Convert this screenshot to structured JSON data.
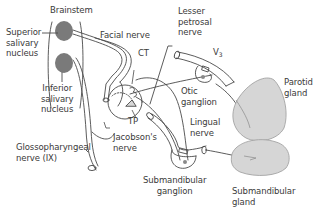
{
  "diagram": {
    "colors": {
      "line": "#4a4a4a",
      "nucleus_fill": "#7a7a7a",
      "gland_fill": "#d6d6d6",
      "gland_stroke": "#9a9a9a",
      "text": "#3a3a3a"
    },
    "labels": {
      "brainstem": "Brainstem",
      "superior_salivary_nucleus": "Superior\nsalivary\nnucleus",
      "inferior_salivary_nucleus": "Inferior\nsalivary\nnucleus",
      "facial_nerve": "Facial nerve",
      "ct": "CT",
      "tp": "TP",
      "lesser_petrosal_nerve": "Lesser\npetrosal\nnerve",
      "v3_base": "V",
      "v3_sub": "3",
      "otic_ganglion": "Otic\nganglion",
      "parotid_gland": "Parotid\ngland",
      "jacobsons_nerve": "Jacobson's\nnerve",
      "glossopharyngeal_nerve": "Glossopharyngeal\nnerve (IX)",
      "lingual_nerve": "Lingual\nnerve",
      "submandibular_ganglion": "Submandibular\nganglion",
      "submandibular_gland": "Submandibular\ngland"
    }
  }
}
